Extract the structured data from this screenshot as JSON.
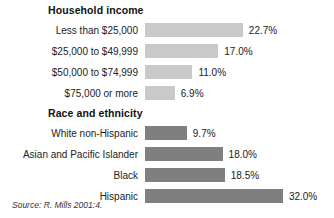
{
  "source_note": "Source: R. Mills 2001:4.",
  "colors": {
    "bar_light": "#c9c9c9",
    "bar_dark": "#7f7f7f",
    "background": "#ffffff",
    "text": "#1a1a1a"
  },
  "sections": [
    {
      "title": "Household income",
      "bar_style": "light",
      "rows": [
        {
          "label": "Less than $25,000",
          "value": 22.7,
          "value_label": "22.7%"
        },
        {
          "label": "$25,000 to $49,999",
          "value": 17.0,
          "value_label": "17.0%"
        },
        {
          "label": "$50,000 to $74,999",
          "value": 11.0,
          "value_label": "11.0%"
        },
        {
          "label": "$75,000 or more",
          "value": 6.9,
          "value_label": "6.9%"
        }
      ]
    },
    {
      "title": "Race and ethnicity",
      "bar_style": "dark",
      "rows": [
        {
          "label": "White non-Hispanic",
          "value": 9.7,
          "value_label": "9.7%"
        },
        {
          "label": "Asian and Pacific Islander",
          "value": 18.0,
          "value_label": "18.0%"
        },
        {
          "label": "Black",
          "value": 18.5,
          "value_label": "18.5%"
        },
        {
          "label": "Hispanic",
          "value": 32.0,
          "value_label": "32.0%"
        }
      ]
    }
  ],
  "chart_data": {
    "type": "bar",
    "orientation": "horizontal",
    "title": "",
    "xlabel": "",
    "ylabel": "",
    "grid": false,
    "legend": "none",
    "value_format": "percent",
    "xlim": [
      0,
      32
    ],
    "groups": [
      {
        "name": "Household income",
        "categories": [
          "Less than $25,000",
          "$25,000 to $49,999",
          "$50,000 to $74,999",
          "$75,000 or more"
        ],
        "values": [
          22.7,
          17.0,
          11.0,
          6.9
        ],
        "data_labels": [
          "22.7%",
          "17.0%",
          "11.0%",
          "6.9%"
        ],
        "color": "#c9c9c9"
      },
      {
        "name": "Race and ethnicity",
        "categories": [
          "White non-Hispanic",
          "Asian and Pacific Islander",
          "Black",
          "Hispanic"
        ],
        "values": [
          9.7,
          18.0,
          18.5,
          32.0
        ],
        "data_labels": [
          "9.7%",
          "18.0%",
          "18.5%",
          "32.0%"
        ],
        "color": "#7f7f7f"
      }
    ],
    "annotations": [
      "Source: R. Mills 2001:4."
    ]
  }
}
